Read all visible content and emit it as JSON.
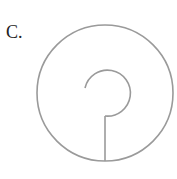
{
  "option_label": "C.",
  "figure": {
    "stroke_color": "#9a9a9a",
    "outer_circle": {
      "cx": 105,
      "cy": 93,
      "r": 68
    },
    "inner_arc": {
      "cx": 108,
      "cy": 93,
      "r": 23
    },
    "stem": {
      "x": 105,
      "y1": 117,
      "y2": 161
    }
  }
}
